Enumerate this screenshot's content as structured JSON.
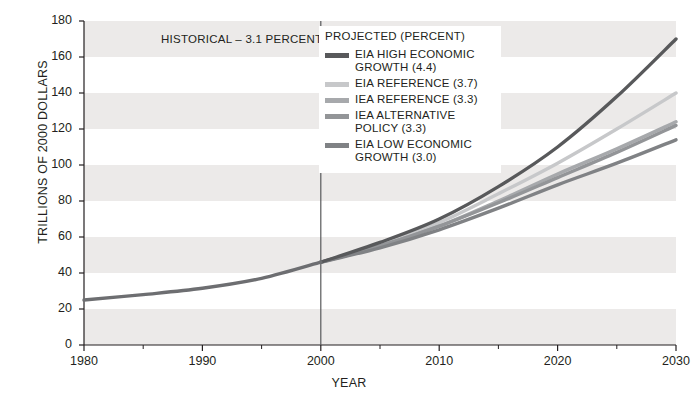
{
  "chart_data": {
    "type": "line",
    "title": "",
    "subtitle": "",
    "xlabel": "YEAR",
    "ylabel": "TRILLIONS OF 2000 DOLLARS",
    "xlim": [
      1980,
      2030
    ],
    "ylim": [
      0,
      180
    ],
    "xticks": [
      1980,
      1990,
      2000,
      2010,
      2020,
      2030
    ],
    "xtick_labels": [
      "1980",
      "1990",
      "2000",
      "2010",
      "2020",
      "2030"
    ],
    "xminor_ticks": [
      1985,
      1995,
      2005,
      2015,
      2025
    ],
    "yticks": [
      0,
      20,
      40,
      60,
      80,
      100,
      120,
      140,
      160,
      180
    ],
    "ytick_labels": [
      "0",
      "20",
      "40",
      "60",
      "80",
      "100",
      "120",
      "140",
      "160",
      "180"
    ],
    "grid": "alternating-horizontal-bands",
    "band_color": "#eceae9",
    "legend_position": "upper-center-right",
    "annotations": [
      {
        "text": "HISTORICAL – 3.1 PERCENT",
        "x": 1993.5,
        "y": 168
      }
    ],
    "divider": {
      "x": 2000,
      "label": "historical-projected-divider",
      "color": "#58595b"
    },
    "series": [
      {
        "name": "HISTORICAL – 3.1 PERCENT",
        "key": "historical",
        "color": "#6d6e71",
        "growth_percent": 3.1,
        "x": [
          1980,
          1985,
          1990,
          1995,
          2000
        ],
        "values": [
          25,
          28,
          31.5,
          37,
          46
        ]
      },
      {
        "name": "EIA HIGH ECONOMIC GROWTH (4.4)",
        "key": "eia_high",
        "color": "#58595b",
        "growth_percent": 4.4,
        "x": [
          2000,
          2005,
          2010,
          2015,
          2020,
          2025,
          2030
        ],
        "values": [
          46,
          57,
          70,
          88,
          110,
          138,
          170
        ]
      },
      {
        "name": "EIA REFERENCE (3.7)",
        "key": "eia_reference",
        "color": "#c7c8ca",
        "growth_percent": 3.7,
        "x": [
          2000,
          2005,
          2010,
          2015,
          2020,
          2025,
          2030
        ],
        "values": [
          46,
          56,
          68,
          84,
          101,
          120,
          140
        ]
      },
      {
        "name": "IEA REFERENCE (3.3)",
        "key": "iea_reference",
        "color": "#a7a9ac",
        "growth_percent": 3.3,
        "x": [
          2000,
          2005,
          2010,
          2015,
          2020,
          2025,
          2030
        ],
        "values": [
          46,
          55,
          66,
          80,
          95,
          109,
          124
        ]
      },
      {
        "name": "IEA ALTERNATIVE POLICY (3.3)",
        "key": "iea_alternative_policy",
        "color": "#939598",
        "growth_percent": 3.3,
        "x": [
          2000,
          2005,
          2010,
          2015,
          2020,
          2025,
          2030
        ],
        "values": [
          46,
          55,
          66,
          79,
          93,
          107,
          122
        ]
      },
      {
        "name": "EIA LOW ECONOMIC GROWTH (3.0)",
        "key": "eia_low",
        "color": "#808285",
        "growth_percent": 3.0,
        "x": [
          2000,
          2005,
          2010,
          2015,
          2020,
          2025,
          2030
        ],
        "values": [
          46,
          54,
          64,
          76,
          89,
          101,
          114
        ]
      }
    ]
  },
  "legend": {
    "title": "PROJECTED (PERCENT)",
    "items": [
      {
        "label": "EIA HIGH ECONOMIC GROWTH (4.4)",
        "color": "#58595b"
      },
      {
        "label": "EIA REFERENCE (3.7)",
        "color": "#c7c8ca"
      },
      {
        "label": "IEA REFERENCE (3.3)",
        "color": "#a7a9ac"
      },
      {
        "label": "IEA ALTERNATIVE POLICY (3.3)",
        "color": "#939598"
      },
      {
        "label": "EIA LOW ECONOMIC GROWTH (3.0)",
        "color": "#808285"
      }
    ]
  },
  "axes": {
    "y_title": "TRILLIONS OF 2000 DOLLARS",
    "x_title": "YEAR"
  },
  "historical_note": "HISTORICAL – 3.1 PERCENT"
}
